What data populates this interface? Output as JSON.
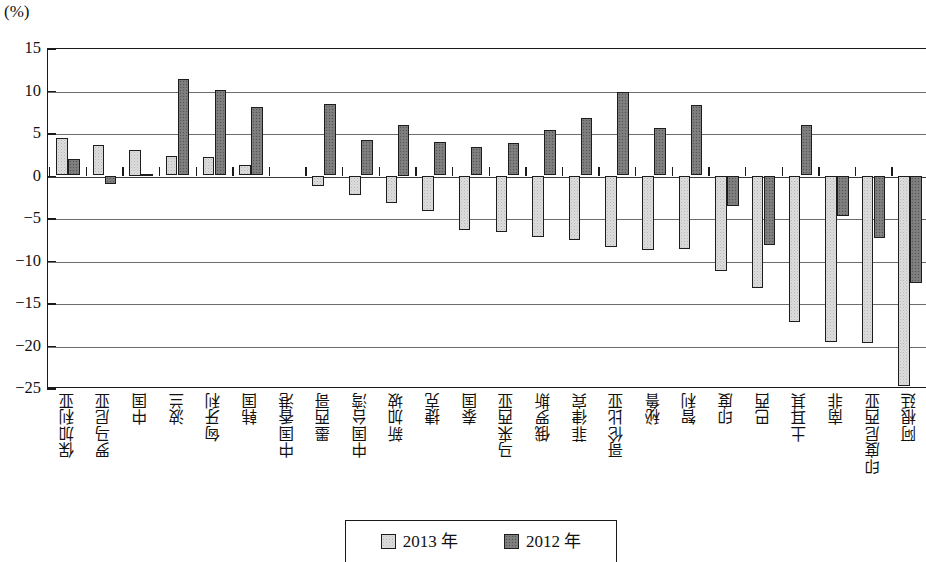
{
  "axis": {
    "unit_label": "(%)",
    "y_ticks": [
      "15",
      "10",
      "5",
      "0",
      "-5",
      "-10",
      "-15",
      "-20",
      "-25"
    ]
  },
  "legend": {
    "items": [
      {
        "label": "2013 年",
        "key": "y2013",
        "color": "#dcdcdc"
      },
      {
        "label": "2012 年",
        "key": "y2012",
        "color": "#7b7b7b"
      }
    ]
  },
  "chart_data": {
    "type": "bar",
    "title": "",
    "subtitle": "",
    "xlabel": "",
    "ylabel": "(%)",
    "ylim": [
      -25,
      15
    ],
    "ytick_values": [
      15,
      10,
      5,
      0,
      -5,
      -10,
      -15,
      -20,
      -25
    ],
    "grid": true,
    "legend_position": "bottom-center",
    "categories": [
      "保加利亚",
      "罗马尼亚",
      "中国",
      "波兰",
      "匈牙利",
      "韩国",
      "中国香港",
      "墨西哥",
      "中国台湾",
      "新加坡",
      "捷克",
      "泰国",
      "马来西亚",
      "俄罗斯",
      "菲律宾",
      "哥伦比亚",
      "秘鲁",
      "智利",
      "印度",
      "巴西",
      "土耳其",
      "南非",
      "印度尼西亚",
      "阿根廷"
    ],
    "series": [
      {
        "name": "2013 年",
        "color": "#dcdcdc",
        "values": [
          4.4,
          3.6,
          3.0,
          2.3,
          2.2,
          1.2,
          0.0,
          -1.2,
          -2.3,
          -3.2,
          -4.2,
          -6.4,
          -6.6,
          -7.2,
          -7.6,
          -8.4,
          -8.8,
          -8.7,
          -11.2,
          -13.2,
          -17.2,
          -19.6,
          -19.7,
          -24.8
        ]
      },
      {
        "name": "2012 年",
        "color": "#7b7b7b",
        "values": [
          1.9,
          -1.0,
          0.2,
          11.4,
          10.1,
          8.1,
          0.0,
          8.4,
          4.2,
          6.0,
          3.9,
          3.3,
          3.8,
          5.3,
          6.8,
          9.8,
          5.6,
          8.3,
          -3.6,
          -8.2,
          5.9,
          -4.8,
          -7.4,
          -12.6
        ]
      }
    ]
  }
}
